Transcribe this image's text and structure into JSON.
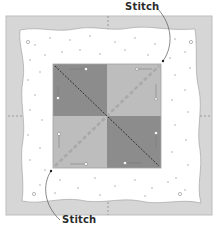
{
  "labels": {
    "top_stitch": "Stitch",
    "bottom_stitch": "Stitch"
  },
  "colors": {
    "outer_background": "#d6d6d6",
    "outer_border": "#bdbdbd",
    "fabric": "#ffffff",
    "fabric_dots": "#c8c8c8",
    "dark_square": "#8c8c8c",
    "light_square": "#bdbdbd",
    "square_border": "#a4a4a4",
    "stitch_line_dark": "#222222",
    "stitch_line_light": "#a9a9a9",
    "callout_line": "#555555",
    "pin": "#ffffff"
  },
  "diagram": {
    "center_block": {
      "quadrants": [
        {
          "position": "top-left",
          "shade": "dark"
        },
        {
          "position": "top-right",
          "shade": "light"
        },
        {
          "position": "bottom-left",
          "shade": "light"
        },
        {
          "position": "bottom-right",
          "shade": "dark"
        }
      ],
      "diagonals": [
        {
          "from": "top-left",
          "to": "bottom-right",
          "style": "dark-dashed"
        },
        {
          "from": "bottom-left",
          "to": "top-right",
          "style": "light-wide-dashed"
        }
      ]
    },
    "callouts": [
      {
        "label_ref": "top_stitch",
        "points_to": "top-right corner of center block"
      },
      {
        "label_ref": "bottom_stitch",
        "points_to": "bottom-left corner of center block"
      }
    ]
  }
}
